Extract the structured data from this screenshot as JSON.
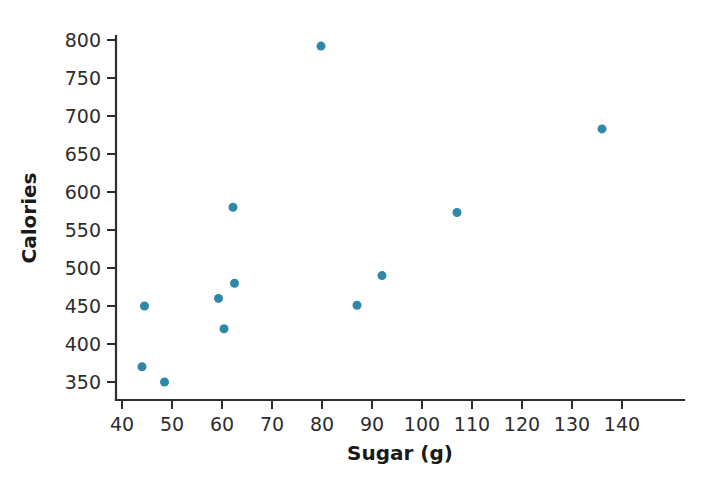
{
  "chart_data": {
    "type": "scatter",
    "title": "",
    "xlabel": "Sugar (g)",
    "ylabel": "Calories",
    "xlim": [
      37,
      145
    ],
    "ylim": [
      337,
      812
    ],
    "xticks": [
      40,
      50,
      60,
      70,
      80,
      90,
      100,
      110,
      120,
      130,
      140
    ],
    "yticks": [
      350,
      400,
      450,
      500,
      550,
      600,
      650,
      700,
      750,
      800
    ],
    "grid": false,
    "legend": null,
    "marker_color": "#2f89a6",
    "marker_size": 9,
    "series": [
      {
        "name": "Cereal",
        "points": [
          {
            "x": 44,
            "y": 370
          },
          {
            "x": 44.5,
            "y": 450
          },
          {
            "x": 48.5,
            "y": 350
          },
          {
            "x": 59.3,
            "y": 460
          },
          {
            "x": 60.4,
            "y": 420
          },
          {
            "x": 62.2,
            "y": 580
          },
          {
            "x": 62.5,
            "y": 480
          },
          {
            "x": 79.8,
            "y": 792
          },
          {
            "x": 87,
            "y": 451
          },
          {
            "x": 92,
            "y": 490
          },
          {
            "x": 107,
            "y": 573
          },
          {
            "x": 136,
            "y": 683
          }
        ]
      }
    ]
  },
  "axes": {
    "x_title": "Sugar (g)",
    "y_title": "Calories",
    "x_tick_labels": [
      "40",
      "50",
      "60",
      "70",
      "80",
      "90",
      "100",
      "110",
      "120",
      "130",
      "140"
    ],
    "y_tick_labels": [
      "350",
      "400",
      "450",
      "500",
      "550",
      "600",
      "650",
      "700",
      "750",
      "800"
    ]
  }
}
